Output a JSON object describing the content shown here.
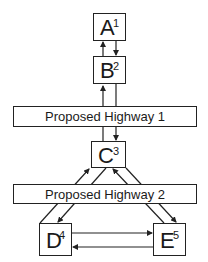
{
  "nodes": [
    {
      "id": "A",
      "label": "A",
      "number": "1"
    },
    {
      "id": "B",
      "label": "B",
      "number": "2"
    },
    {
      "id": "C",
      "label": "C",
      "number": "3"
    },
    {
      "id": "D",
      "label": "D",
      "number": "4"
    },
    {
      "id": "E",
      "label": "E",
      "number": "5"
    }
  ],
  "highways": [
    {
      "label": "Proposed Highway 1"
    },
    {
      "label": "Proposed Highway 2"
    }
  ],
  "edges": [
    {
      "from": "B",
      "to": "A"
    },
    {
      "from": "A",
      "to": "B"
    },
    {
      "from": "C",
      "to": "B"
    },
    {
      "from": "B",
      "to": "C"
    },
    {
      "from": "D",
      "to": "C"
    },
    {
      "from": "C",
      "to": "D"
    },
    {
      "from": "E",
      "to": "C"
    },
    {
      "from": "C",
      "to": "E"
    },
    {
      "from": "D",
      "to": "E"
    },
    {
      "from": "E",
      "to": "D"
    }
  ],
  "colors": {
    "stroke": "#222222",
    "background": "#ffffff"
  }
}
